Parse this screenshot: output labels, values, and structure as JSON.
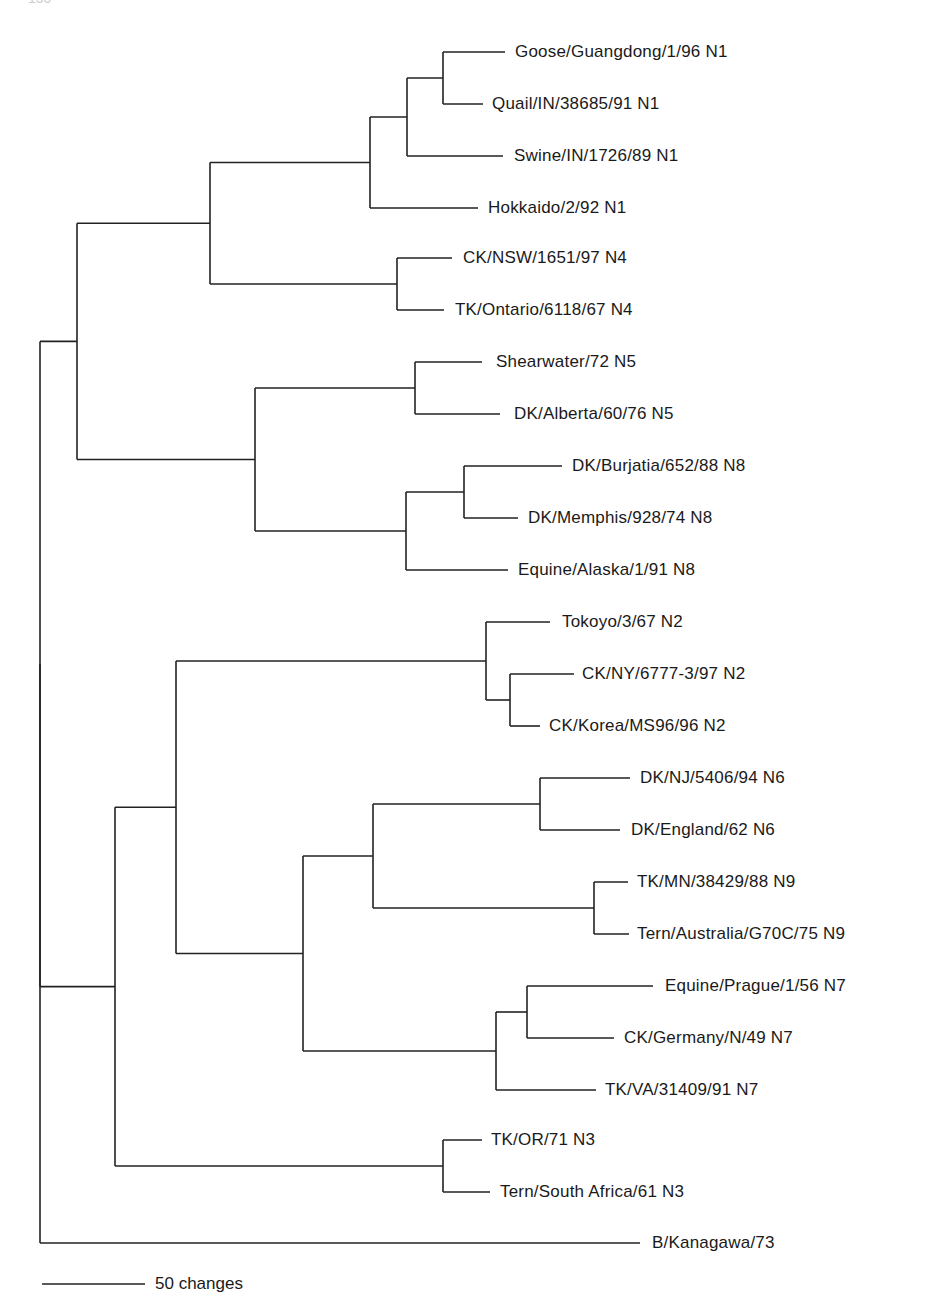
{
  "page": {
    "page_number": "150"
  },
  "tree": {
    "type": "phylogenetic-tree",
    "root_x": 40,
    "leaves": [
      {
        "id": "L1",
        "label": "Goose/Guangdong/1/96 N1",
        "y": 52,
        "x_end": 505,
        "text_x": 515
      },
      {
        "id": "L2",
        "label": "Quail/IN/38685/91 N1",
        "y": 104,
        "x_end": 483,
        "text_x": 492
      },
      {
        "id": "L3",
        "label": "Swine/IN/1726/89 N1",
        "y": 156,
        "x_end": 503,
        "text_x": 514
      },
      {
        "id": "L4",
        "label": "Hokkaido/2/92 N1",
        "y": 208,
        "x_end": 478,
        "text_x": 488
      },
      {
        "id": "L5",
        "label": "CK/NSW/1651/97 N4",
        "y": 258,
        "x_end": 452,
        "text_x": 463
      },
      {
        "id": "L6",
        "label": "TK/Ontario/6118/67 N4",
        "y": 310,
        "x_end": 444,
        "text_x": 455
      },
      {
        "id": "L7",
        "label": "Shearwater/72 N5",
        "y": 362,
        "x_end": 482,
        "text_x": 496
      },
      {
        "id": "L8",
        "label": "DK/Alberta/60/76 N5",
        "y": 414,
        "x_end": 500,
        "text_x": 514
      },
      {
        "id": "L9",
        "label": "DK/Burjatia/652/88 N8",
        "y": 466,
        "x_end": 562,
        "text_x": 572
      },
      {
        "id": "L10",
        "label": "DK/Memphis/928/74 N8",
        "y": 518,
        "x_end": 518,
        "text_x": 528
      },
      {
        "id": "L11",
        "label": "Equine/Alaska/1/91 N8",
        "y": 570,
        "x_end": 508,
        "text_x": 518
      },
      {
        "id": "L12",
        "label": "Tokoyo/3/67 N2",
        "y": 622,
        "x_end": 550,
        "text_x": 562
      },
      {
        "id": "L13",
        "label": "CK/NY/6777-3/97 N2",
        "y": 674,
        "x_end": 574,
        "text_x": 582
      },
      {
        "id": "L14",
        "label": "CK/Korea/MS96/96 N2",
        "y": 726,
        "x_end": 540,
        "text_x": 549
      },
      {
        "id": "L15",
        "label": "DK/NJ/5406/94 N6",
        "y": 778,
        "x_end": 630,
        "text_x": 640
      },
      {
        "id": "L16",
        "label": "DK/England/62 N6",
        "y": 830,
        "x_end": 620,
        "text_x": 631
      },
      {
        "id": "L17",
        "label": "TK/MN/38429/88 N9",
        "y": 882,
        "x_end": 628,
        "text_x": 637
      },
      {
        "id": "L18",
        "label": "Tern/Australia/G70C/75 N9",
        "y": 934,
        "x_end": 629,
        "text_x": 637
      },
      {
        "id": "L19",
        "label": "Equine/Prague/1/56 N7",
        "y": 986,
        "x_end": 653,
        "text_x": 665
      },
      {
        "id": "L20",
        "label": "CK/Germany/N/49 N7",
        "y": 1038,
        "x_end": 614,
        "text_x": 624
      },
      {
        "id": "L21",
        "label": "TK/VA/31409/91 N7",
        "y": 1090,
        "x_end": 596,
        "text_x": 605
      },
      {
        "id": "L22",
        "label": "TK/OR/71 N3",
        "y": 1140,
        "x_end": 482,
        "text_x": 491
      },
      {
        "id": "L23",
        "label": "Tern/South Africa/61 N3",
        "y": 1192,
        "x_end": 490,
        "text_x": 500
      },
      {
        "id": "L24",
        "label": "B/Kanagawa/73",
        "y": 1243,
        "x_end": 640,
        "text_x": 652
      }
    ],
    "nodes": [
      {
        "id": "n_goose_quail",
        "x": 443,
        "children": [
          "L1",
          "L2"
        ]
      },
      {
        "id": "n_gq_swine",
        "x": 407,
        "children": [
          "n_goose_quail",
          "L3"
        ]
      },
      {
        "id": "n_N1",
        "x": 370,
        "children": [
          "n_gq_swine",
          "L4"
        ]
      },
      {
        "id": "n_N4",
        "x": 397,
        "children": [
          "L5",
          "L6"
        ]
      },
      {
        "id": "n_N1_N4",
        "x": 210,
        "children": [
          "n_N1",
          "n_N4"
        ]
      },
      {
        "id": "n_N5",
        "x": 415,
        "children": [
          "L7",
          "L8"
        ]
      },
      {
        "id": "n_burj_memph",
        "x": 464,
        "children": [
          "L9",
          "L10"
        ]
      },
      {
        "id": "n_N8",
        "x": 406,
        "children": [
          "n_burj_memph",
          "L11"
        ]
      },
      {
        "id": "n_N5_N8",
        "x": 255,
        "children": [
          "n_N5",
          "n_N8"
        ]
      },
      {
        "id": "n_upper",
        "x": 77,
        "children": [
          "n_N1_N4",
          "n_N5_N8"
        ]
      },
      {
        "id": "n_ny_korea",
        "x": 510,
        "children": [
          "L13",
          "L14"
        ]
      },
      {
        "id": "n_N2",
        "x": 486,
        "children": [
          "L12",
          "n_ny_korea"
        ]
      },
      {
        "id": "n_N6",
        "x": 540,
        "children": [
          "L15",
          "L16"
        ]
      },
      {
        "id": "n_N9",
        "x": 594,
        "children": [
          "L17",
          "L18"
        ]
      },
      {
        "id": "n_N6_N9",
        "x": 373,
        "children": [
          "n_N6",
          "n_N9"
        ]
      },
      {
        "id": "n_prague_germany",
        "x": 527,
        "children": [
          "L19",
          "L20"
        ]
      },
      {
        "id": "n_N7",
        "x": 496,
        "children": [
          "n_prague_germany",
          "L21"
        ]
      },
      {
        "id": "n_N6_N9_N7",
        "x": 303,
        "children": [
          "n_N6_N9",
          "n_N7"
        ]
      },
      {
        "id": "n_N2_rest",
        "x": 176,
        "children": [
          "n_N2",
          "n_N6_N9_N7"
        ]
      },
      {
        "id": "n_N3",
        "x": 443,
        "children": [
          "L22",
          "L23"
        ]
      },
      {
        "id": "n_lower",
        "x": 115,
        "children": [
          "n_N2_rest",
          "n_N3"
        ]
      },
      {
        "id": "n_ingroup",
        "x": 40,
        "children": [
          "n_upper",
          "n_lower"
        ]
      },
      {
        "id": "root",
        "x": 40,
        "children": [
          "n_ingroup",
          "L24"
        ]
      }
    ],
    "root_node": "root"
  },
  "scale_bar": {
    "label": "50 changes",
    "x1": 42,
    "x2": 145,
    "y": 1284,
    "label_x": 155
  }
}
